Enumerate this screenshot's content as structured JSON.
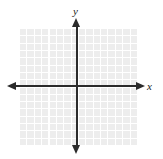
{
  "figure": {
    "type": "blank-coordinate-grid",
    "background_color": "#ffffff",
    "axis_color": "#2b2b2b",
    "grid_fill_color": "#ededed",
    "grid_line_color": "#ffffff"
  },
  "axes": {
    "x_label": "x",
    "y_label": "y",
    "x_axis_name": "horizontal-axis",
    "y_axis_name": "vertical-axis",
    "arrows": {
      "left": "arrow-left",
      "right": "arrow-right",
      "up": "arrow-up",
      "down": "arrow-down"
    }
  },
  "chart_data": {
    "type": "scatter",
    "title": "",
    "subtitle": "",
    "xlabel": "x",
    "ylabel": "y",
    "x": [],
    "y": [],
    "series": [],
    "annotations": [],
    "legend": [],
    "legend_position": "none",
    "grid": true,
    "grid_columns": 16,
    "grid_rows": 16,
    "xlim": [
      -8,
      8
    ],
    "ylim": [
      -8,
      8
    ],
    "xticks": [],
    "yticks": [],
    "xticklabels": [],
    "yticklabels": [],
    "note": "Empty coordinate plane: light shaded square grid with white gridlines, double-headed x and y axes, no plotted data and no numeric tick labels."
  }
}
